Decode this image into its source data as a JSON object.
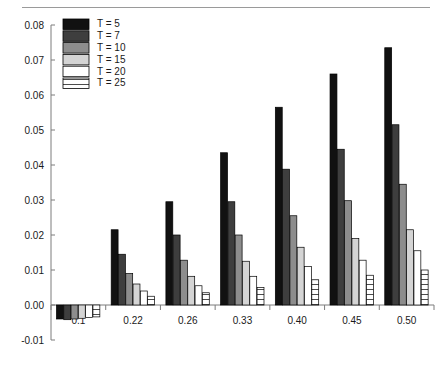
{
  "figure": {
    "background": "#ffffff",
    "has_top_rule": true
  },
  "chart_data": {
    "type": "bar",
    "title": "",
    "xlabel": "",
    "ylabel": "",
    "categories": [
      "0.1",
      "0.22",
      "0.26",
      "0.33",
      "0.40",
      "0.45",
      "0.50"
    ],
    "ylim": [
      -0.01,
      0.08
    ],
    "yticks": [
      -0.01,
      0.0,
      0.01,
      0.02,
      0.03,
      0.04,
      0.05,
      0.06,
      0.07,
      0.08
    ],
    "ytick_labels": [
      "-0.01",
      "0.00",
      "0.01",
      "0.02",
      "0.03",
      "0.04",
      "0.05",
      "0.06",
      "0.07",
      "0.08"
    ],
    "grid": false,
    "legend_position": "upper-left",
    "series": [
      {
        "name": "T = 5",
        "color": "#111111",
        "pattern": "solid",
        "values": [
          -0.004,
          0.0215,
          0.0295,
          0.0435,
          0.0565,
          0.066,
          0.0735
        ]
      },
      {
        "name": "T = 7",
        "color": "#3e3e3e",
        "pattern": "solid",
        "values": [
          -0.0042,
          0.0145,
          0.02,
          0.0295,
          0.0388,
          0.0445,
          0.0515
        ]
      },
      {
        "name": "T = 10",
        "color": "#8d8d8d",
        "pattern": "solid",
        "values": [
          -0.004,
          0.009,
          0.0128,
          0.02,
          0.0255,
          0.0298,
          0.0345
        ]
      },
      {
        "name": "T = 15",
        "color": "#d4d4d4",
        "pattern": "solid",
        "values": [
          -0.0038,
          0.006,
          0.0082,
          0.0125,
          0.0165,
          0.019,
          0.0215
        ]
      },
      {
        "name": "T = 20",
        "color": "#ffffff",
        "pattern": "solid",
        "values": [
          -0.0036,
          0.004,
          0.0055,
          0.0082,
          0.011,
          0.0128,
          0.0155
        ]
      },
      {
        "name": "T = 25",
        "color": "#ffffff",
        "pattern": "hatch-horizontal",
        "values": [
          -0.0034,
          0.0025,
          0.0035,
          0.005,
          0.0072,
          0.0085,
          0.01
        ]
      }
    ]
  }
}
